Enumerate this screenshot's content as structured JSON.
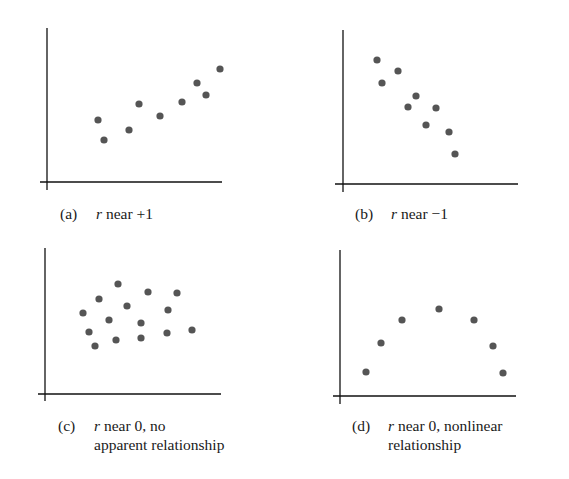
{
  "figure": {
    "dot_color": "#555555",
    "axis_color": "#111111",
    "background": "#ffffff"
  },
  "chart_data": [
    {
      "type": "scatter",
      "panel": "a",
      "title": "",
      "caption": {
        "tag": "(a)",
        "var": "r",
        "line1": " near +1",
        "line2": ""
      },
      "xlabel": "",
      "ylabel": "",
      "grid": false,
      "description": "strong positive linear correlation",
      "axes_px": {
        "origin": [
          47,
          182
        ],
        "x_end": 222,
        "y_top": 28,
        "x_start": 40,
        "y_bottom": 190
      },
      "points_px": [
        [
          98,
          120
        ],
        [
          104,
          140
        ],
        [
          129,
          130
        ],
        [
          139,
          104
        ],
        [
          160,
          116
        ],
        [
          182,
          102
        ],
        [
          197,
          83
        ],
        [
          206,
          95
        ],
        [
          220,
          69
        ]
      ]
    },
    {
      "type": "scatter",
      "panel": "b",
      "title": "",
      "caption": {
        "tag": "(b)",
        "var": "r",
        "line1": " near −1",
        "line2": ""
      },
      "xlabel": "",
      "ylabel": "",
      "grid": false,
      "description": "strong negative linear correlation",
      "axes_px": {
        "origin": [
          343,
          184
        ],
        "x_end": 518,
        "y_top": 30,
        "x_start": 335,
        "y_bottom": 192
      },
      "points_px": [
        [
          377,
          60
        ],
        [
          398,
          71
        ],
        [
          382,
          83
        ],
        [
          416,
          96
        ],
        [
          408,
          107
        ],
        [
          436,
          108
        ],
        [
          426,
          125
        ],
        [
          449,
          132
        ],
        [
          455,
          154
        ]
      ]
    },
    {
      "type": "scatter",
      "panel": "c",
      "title": "",
      "caption": {
        "tag": "(c)",
        "var": "r",
        "line1": " near 0, no",
        "line2": "apparent relationship"
      },
      "xlabel": "",
      "ylabel": "",
      "grid": false,
      "description": "no apparent relationship",
      "axes_px": {
        "origin": [
          45,
          394
        ],
        "x_end": 221,
        "y_top": 248,
        "x_start": 38,
        "y_bottom": 401
      },
      "points_px": [
        [
          118,
          284
        ],
        [
          148,
          292
        ],
        [
          177,
          293
        ],
        [
          99,
          299
        ],
        [
          127,
          306
        ],
        [
          168,
          310
        ],
        [
          83,
          313
        ],
        [
          109,
          320
        ],
        [
          141,
          323
        ],
        [
          89,
          332
        ],
        [
          192,
          330
        ],
        [
          167,
          333
        ],
        [
          141,
          338
        ],
        [
          116,
          340
        ],
        [
          95,
          346
        ]
      ]
    },
    {
      "type": "scatter",
      "panel": "d",
      "title": "",
      "caption": {
        "tag": "(d)",
        "var": "r",
        "line1": " near 0, nonlinear",
        "line2": "relationship"
      },
      "xlabel": "",
      "ylabel": "",
      "grid": false,
      "description": "nonlinear (inverted-U) relationship",
      "axes_px": {
        "origin": [
          340,
          396
        ],
        "x_end": 516,
        "y_top": 250,
        "x_start": 333,
        "y_bottom": 404
      },
      "points_px": [
        [
          366,
          372
        ],
        [
          381,
          343
        ],
        [
          402,
          320
        ],
        [
          439,
          309
        ],
        [
          474,
          320
        ],
        [
          493,
          346
        ],
        [
          503,
          373
        ]
      ]
    }
  ]
}
